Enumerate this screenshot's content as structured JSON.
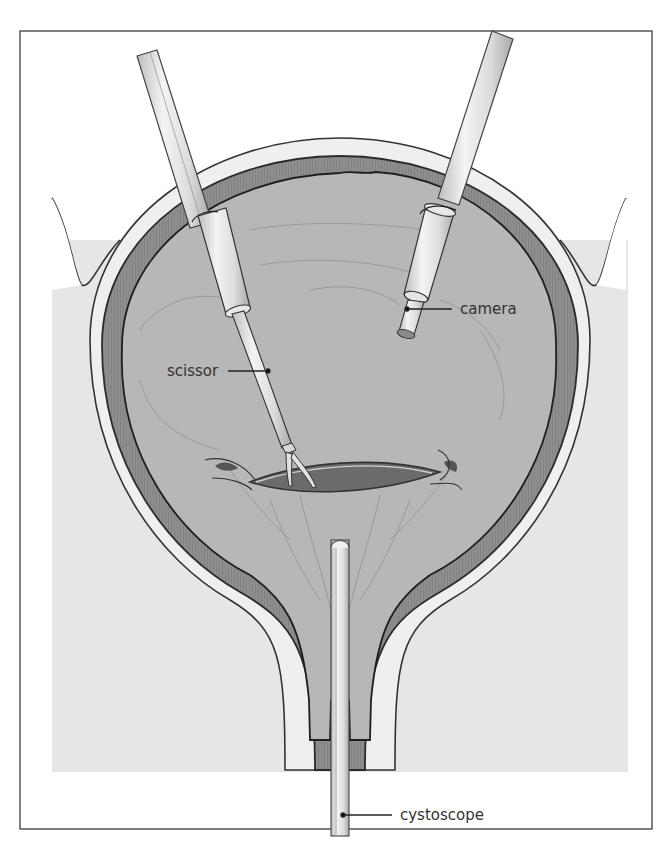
{
  "figure": {
    "type": "anatomical-illustration"
  },
  "labels": {
    "camera": "camera",
    "scissor": "scissor",
    "cystoscope": "cystoscope"
  },
  "colors": {
    "frame_border": "#555555",
    "background": "#ffffff",
    "outer_tissue": "#e6e6e6",
    "serosa": "#ececec",
    "muscle_wall": "#8c8c8c",
    "bladder_lumen": "#b5b5b5",
    "incision": "#6f6f6f",
    "instrument": "#e4e4e4",
    "outline": "#2b2b2b",
    "label_text": "#333333"
  }
}
